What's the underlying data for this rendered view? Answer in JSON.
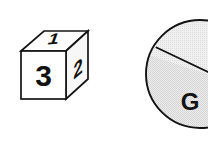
{
  "canvas": {
    "width": 208,
    "height": 155,
    "background_color": "#ffffff"
  },
  "figure": {
    "title": "",
    "elements": [
      {
        "name": "numbered-cube",
        "type": "isometric-cube",
        "stroke_color": "#151515",
        "faces": [
          {
            "face": "front",
            "label": "3",
            "fill_color": "#ffffff"
          },
          {
            "face": "top",
            "label": "1",
            "fill_color": "#fdfdfd"
          },
          {
            "face": "right",
            "label": "2",
            "fill_color": "#f7f7f7"
          }
        ]
      },
      {
        "name": "sectioned-circle",
        "type": "pie",
        "stroke_color": "#131313",
        "clipped": "right edge",
        "sectors": [
          {
            "label": "",
            "fill_color": "#eeeeee"
          },
          {
            "label": "G",
            "fill_color": "#e8e8e8"
          }
        ]
      }
    ]
  },
  "cube": {
    "front_label": "3",
    "top_label": "1",
    "right_label": "2"
  },
  "circle": {
    "sector_label": "G"
  }
}
